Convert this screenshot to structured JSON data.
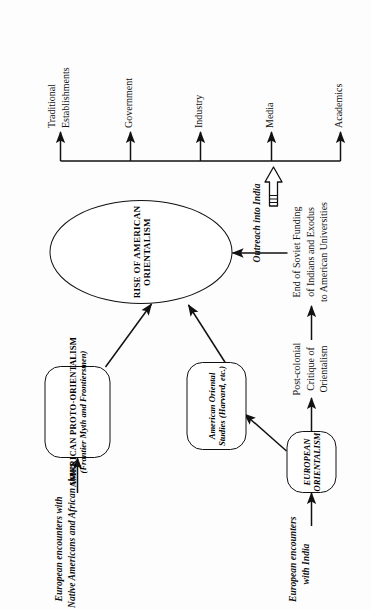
{
  "diagram": {
    "orientation": "rotated-90-ccw",
    "ink_color": "#111111",
    "background": "#fdfdfd",
    "nodes": {
      "euro_encounters_india": {
        "line1": "European encounters",
        "line2": "with India"
      },
      "european_orientalism": {
        "line1": "EUROPEAN",
        "line2": "ORIENTALISM"
      },
      "postcolonial_critique": {
        "line1": "Post-colonial",
        "line2": "Critique of",
        "line3": "Orientalism"
      },
      "soviet_funding": {
        "line1": "End of Soviet Funding",
        "line2": "of Indians and Exodus",
        "line3": "to American Universities"
      },
      "euro_encounters_natives": {
        "line1": "European encounters with",
        "line2": "Native Americans and African slaves"
      },
      "proto_orientalism": {
        "line1": "AMERICAN PROTO-ORIENTALISM",
        "line2": "(Frontier Myth and Frontiersmen)"
      },
      "oriental_studies": {
        "line1": "American Oriental",
        "line2": "Studies (Harvard, etc.)"
      },
      "rise_american_orientalism": {
        "label": "RISE OF AMERICAN ORIENTALISM"
      },
      "outreach": {
        "label": "Outreach into India",
        "icon": "block-arrow-right-icon"
      }
    },
    "outputs": [
      {
        "label": "Academics"
      },
      {
        "label": "Media"
      },
      {
        "label": "Industry"
      },
      {
        "label": "Government"
      },
      {
        "label": "Traditional\nEstablishments",
        "line1": "Traditional",
        "line2": "Establishments"
      }
    ]
  }
}
